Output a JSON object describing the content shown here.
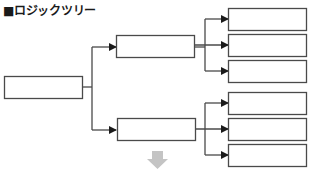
{
  "title": "■ロジックツリー",
  "colors": {
    "box_stroke": "#4a4a4a",
    "arrow_fill": "#1a1a1a",
    "down_arrow": "#c4c4c4"
  },
  "tree": {
    "root": {
      "label": ""
    },
    "branches": [
      {
        "label": "",
        "children": [
          {
            "label": ""
          },
          {
            "label": ""
          },
          {
            "label": ""
          }
        ]
      },
      {
        "label": "",
        "children": [
          {
            "label": ""
          },
          {
            "label": ""
          },
          {
            "label": ""
          }
        ]
      }
    ]
  },
  "icons": {
    "continue": "down-arrow-icon"
  }
}
